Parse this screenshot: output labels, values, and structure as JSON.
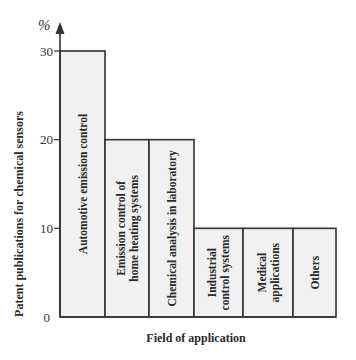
{
  "chart_data": {
    "type": "bar",
    "title": "",
    "xlabel": "Field of application",
    "ylabel": "Patent publications for chemical sensors",
    "y_unit": "%",
    "ylim": [
      0,
      30
    ],
    "yticks": [
      0,
      10,
      20,
      30
    ],
    "grid": false,
    "legend": null,
    "categories": [
      "Automotive emission control",
      "Emission control of home heating systems",
      "Chemical analysis in laboratory",
      "Industrial control systems",
      "Medical applications",
      "Others"
    ],
    "category_label_lines": [
      [
        "Automotive emission control"
      ],
      [
        "Emission control of",
        "home heating systems"
      ],
      [
        "Chemical analysis in laboratory"
      ],
      [
        "Industrial",
        "control systems"
      ],
      [
        "Medical",
        "applications"
      ],
      [
        "Others"
      ]
    ],
    "values": [
      30,
      20,
      20,
      10,
      10,
      10
    ],
    "colors": {
      "bar_fill": "#f1f1f1",
      "bar_stroke": "#333333",
      "text": "#2a2a2a"
    }
  }
}
